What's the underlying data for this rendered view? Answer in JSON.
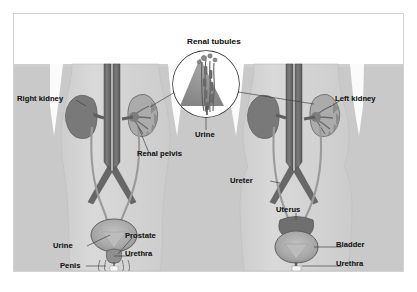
{
  "figure": {
    "style": "grayscale scanned textbook illustration",
    "frame_color": "#d2d2d2",
    "background_color": "#ffffff"
  },
  "palette": {
    "page_white": "#ffffff",
    "band_gray": "#c9c9c9",
    "body_gray": "#d6d6d6",
    "body_gray_dark": "#cfcfcf",
    "organ_dark": "#6f6f6f",
    "organ_mid": "#8a8a8a",
    "organ_light": "#a8a8a8",
    "vessel_dark": "#5f5f5f",
    "outline": "#4a4a4a",
    "label_text": "#1b1b1b",
    "leader_line": "#3a3a3a",
    "inset_fill": "#ffffff",
    "inset_border": "#2b2b2b"
  },
  "inset": {
    "name": "renal-tubules-magnifier",
    "title": "Renal tubules",
    "shape": "circle",
    "center_x": 205,
    "center_y": 83,
    "radius": 33
  },
  "labels": [
    {
      "id": "renal-tubules",
      "text": "Renal tubules",
      "x": 173,
      "y": 36,
      "title": true
    },
    {
      "id": "right-kidney",
      "text": "Right kidney",
      "x": 16,
      "y": 93,
      "title": false
    },
    {
      "id": "left-kidney",
      "text": "Left kidney",
      "x": 334,
      "y": 93,
      "title": false
    },
    {
      "id": "urine-center",
      "text": "Urine",
      "x": 194,
      "y": 129,
      "title": false
    },
    {
      "id": "renal-pelvis",
      "text": "Renal pelvis",
      "x": 136,
      "y": 148,
      "title": false
    },
    {
      "id": "ureter",
      "text": "Ureter",
      "x": 243,
      "y": 175,
      "title": false
    },
    {
      "id": "uterus",
      "text": "Uterus",
      "x": 288,
      "y": 204,
      "title": false
    },
    {
      "id": "prostate",
      "text": "Prostate",
      "x": 124,
      "y": 230,
      "title": false
    },
    {
      "id": "urine-male",
      "text": "Urine",
      "x": 52,
      "y": 240,
      "title": false
    },
    {
      "id": "urethra-male",
      "text": "Urethra",
      "x": 124,
      "y": 248,
      "title": false
    },
    {
      "id": "bladder",
      "text": "Bladder",
      "x": 335,
      "y": 238,
      "title": false
    },
    {
      "id": "penis",
      "text": "Penis",
      "x": 59,
      "y": 260,
      "title": false
    },
    {
      "id": "urethra-female",
      "text": "Urethra",
      "x": 335,
      "y": 258,
      "title": false
    }
  ],
  "anatomy": {
    "male_figure": {
      "side": "left",
      "parts": [
        "right kidney",
        "left kidney (cutaway)",
        "renal pelvis",
        "ureter",
        "bladder",
        "prostate",
        "urethra",
        "penis",
        "aorta",
        "vena cava",
        "iliac vessels"
      ]
    },
    "female_figure": {
      "side": "right",
      "parts": [
        "right kidney",
        "left kidney (cutaway)",
        "ureter",
        "uterus",
        "bladder",
        "urethra",
        "aorta",
        "vena cava",
        "iliac vessels"
      ]
    }
  }
}
